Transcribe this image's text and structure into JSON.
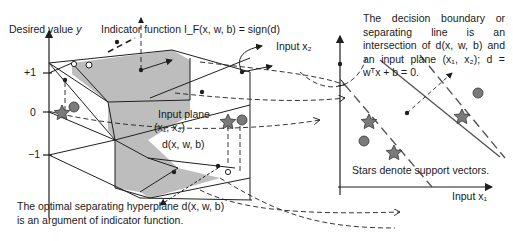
{
  "left_panel": {
    "y_axis_label": "Desired value",
    "y_axis_var": "y",
    "tick_plus1": "+1",
    "tick_zero": "0",
    "tick_minus1": "−1",
    "indicator_label_prefix": "Indicator function",
    "indicator_formula": "I_F(x, w, b) = sign(d)",
    "input_x2_label": "Input x₂",
    "input_plane_label": "Input plane",
    "input_plane_coords": "(x₁, x₂)",
    "hyperplane_label": "d(x, w, b)"
  },
  "bottom_caption": {
    "line1": "The optimal separating hyperplane d(x, w, b)",
    "line2": "is an argument of indicator function."
  },
  "right_panel": {
    "note_lines": [
      "The decision boundary or",
      "separating line is an",
      "intersection of d(x, w, b) and",
      "an input plane (x₁, x₂); d =",
      "wᵀx + b = 0."
    ],
    "support_vectors_note": "Stars denote support vectors.",
    "x_axis_label": "Input x₁"
  },
  "colors": {
    "line": "#1f1f1f",
    "shade": "#bdbdbd",
    "marker_fill": "#7a7a7a",
    "background": "#ffffff"
  }
}
